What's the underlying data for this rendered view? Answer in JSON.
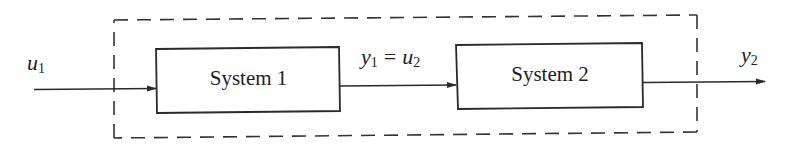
{
  "diagram": {
    "type": "series-connection-block-diagram",
    "colors": {
      "line": "#2a2a2a",
      "background": "#ffffff",
      "text": "#1e1e1e"
    },
    "enclosure": {
      "style": "dashed",
      "description": "overall composite system"
    },
    "blocks": [
      {
        "id": "system1",
        "label": "System 1"
      },
      {
        "id": "system2",
        "label": "System 2"
      }
    ],
    "signals": {
      "input": {
        "var": "u",
        "sub": "1"
      },
      "intermediate": {
        "left": {
          "var": "y",
          "sub": "1"
        },
        "equals": "=",
        "right": {
          "var": "u",
          "sub": "2"
        }
      },
      "output": {
        "var": "y",
        "sub": "2"
      }
    },
    "connections": [
      {
        "from": "input",
        "to": "system1",
        "label": "u1"
      },
      {
        "from": "system1",
        "to": "system2",
        "label": "y1 = u2"
      },
      {
        "from": "system2",
        "to": "output",
        "label": "y2"
      }
    ]
  }
}
